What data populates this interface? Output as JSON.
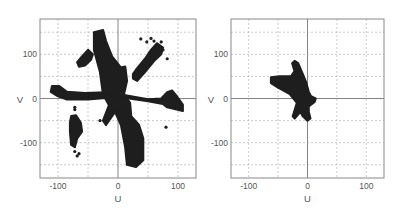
{
  "chart_data": [
    {
      "type": "scatter",
      "panel": "left",
      "title": "",
      "xlabel": "U",
      "ylabel": "V",
      "xlim": [
        -130,
        130
      ],
      "ylim": [
        -180,
        180
      ],
      "xticks": [
        -100,
        0,
        100
      ],
      "yticks": [
        100,
        0,
        -100
      ],
      "grid": true,
      "grid_step": 50,
      "description": "Dense (u,v) coverage sampling with a central cross and several outlying arms",
      "regions": [
        {
          "name": "central-ne-sw-arm",
          "polygon": [
            [
              -40,
              150
            ],
            [
              -25,
              155
            ],
            [
              -20,
              130
            ],
            [
              -10,
              95
            ],
            [
              5,
              70
            ],
            [
              12,
              72
            ],
            [
              15,
              40
            ],
            [
              10,
              10
            ],
            [
              20,
              -10
            ],
            [
              22,
              -40
            ],
            [
              35,
              -60
            ],
            [
              42,
              -90
            ],
            [
              42,
              -140
            ],
            [
              30,
              -155
            ],
            [
              15,
              -150
            ],
            [
              12,
              -110
            ],
            [
              5,
              -60
            ],
            [
              -5,
              -30
            ],
            [
              -20,
              -60
            ],
            [
              -25,
              -50
            ],
            [
              -15,
              -15
            ],
            [
              -25,
              10
            ],
            [
              -30,
              60
            ],
            [
              -40,
              110
            ]
          ]
        },
        {
          "name": "west-arm",
          "polygon": [
            [
              -110,
              28
            ],
            [
              -98,
              28
            ],
            [
              -85,
              15
            ],
            [
              -55,
              12
            ],
            [
              -20,
              14
            ],
            [
              -15,
              2
            ],
            [
              -50,
              -2
            ],
            [
              -85,
              -2
            ],
            [
              -100,
              5
            ],
            [
              -112,
              15
            ]
          ]
        },
        {
          "name": "east-arm",
          "polygon": [
            [
              10,
              2
            ],
            [
              50,
              -6
            ],
            [
              75,
              -12
            ],
            [
              82,
              -20
            ],
            [
              108,
              -28
            ],
            [
              108,
              -14
            ],
            [
              98,
              5
            ],
            [
              90,
              18
            ],
            [
              82,
              14
            ],
            [
              72,
              0
            ],
            [
              50,
              -2
            ],
            [
              10,
              8
            ]
          ]
        },
        {
          "name": "nw-cluster",
          "polygon": [
            [
              -68,
              82
            ],
            [
              -60,
              95
            ],
            [
              -50,
              110
            ],
            [
              -42,
              100
            ],
            [
              -45,
              88
            ],
            [
              -55,
              75
            ],
            [
              -65,
              72
            ]
          ]
        },
        {
          "name": "ne-arm",
          "polygon": [
            [
              25,
              45
            ],
            [
              32,
              40
            ],
            [
              45,
              60
            ],
            [
              60,
              85
            ],
            [
              72,
              100
            ],
            [
              75,
              115
            ],
            [
              65,
              125
            ],
            [
              55,
              110
            ],
            [
              45,
              90
            ],
            [
              30,
              65
            ],
            [
              25,
              55
            ]
          ]
        },
        {
          "name": "sw-cluster",
          "polygon": [
            [
              -78,
              -40
            ],
            [
              -70,
              -38
            ],
            [
              -62,
              -55
            ],
            [
              -60,
              -75
            ],
            [
              -68,
              -90
            ],
            [
              -72,
              -110
            ],
            [
              -78,
              -105
            ],
            [
              -80,
              -75
            ],
            [
              -80,
              -55
            ]
          ]
        }
      ],
      "points": [
        [
          -72,
          -25
        ],
        [
          -68,
          -130
        ],
        [
          -72,
          -120
        ],
        [
          55,
          136
        ],
        [
          60,
          130
        ],
        [
          72,
          128
        ],
        [
          75,
          110
        ],
        [
          82,
          90
        ],
        [
          80,
          -65
        ],
        [
          48,
          128
        ],
        [
          38,
          135
        ],
        [
          65,
          120
        ],
        [
          -30,
          -50
        ],
        [
          -72,
          -20
        ],
        [
          -65,
          -125
        ]
      ],
      "point_color": "#1e1e1e"
    },
    {
      "type": "scatter",
      "panel": "right",
      "title": "",
      "xlabel": "U",
      "ylabel": "V",
      "xlim": [
        -130,
        130
      ],
      "ylim": [
        -180,
        180
      ],
      "xticks": [
        -100,
        0,
        100
      ],
      "yticks": [
        100,
        0,
        -100
      ],
      "grid": true,
      "grid_step": 50,
      "description": "Compact (u,v) coverage shaped like an airplane silhouette near the origin",
      "regions": [
        {
          "name": "central-blob",
          "polygon": [
            [
              -22,
              85
            ],
            [
              -16,
              80
            ],
            [
              -8,
              55
            ],
            [
              -2,
              35
            ],
            [
              2,
              15
            ],
            [
              6,
              5
            ],
            [
              14,
              0
            ],
            [
              12,
              -8
            ],
            [
              2,
              -18
            ],
            [
              2,
              -30
            ],
            [
              5,
              -45
            ],
            [
              0,
              -50
            ],
            [
              -8,
              -40
            ],
            [
              -12,
              -30
            ],
            [
              -22,
              -45
            ],
            [
              -25,
              -40
            ],
            [
              -18,
              -10
            ],
            [
              -30,
              10
            ],
            [
              -50,
              25
            ],
            [
              -62,
              35
            ],
            [
              -62,
              48
            ],
            [
              -48,
              50
            ],
            [
              -28,
              50
            ],
            [
              -22,
              62
            ],
            [
              -26,
              80
            ]
          ]
        }
      ],
      "points": [],
      "point_color": "#1e1e1e"
    }
  ],
  "panels": {
    "left": {
      "x_label": "U",
      "y_label": "V",
      "ticks_x": [
        "-100",
        "0",
        "100"
      ],
      "ticks_y": [
        "100",
        "0",
        "-100"
      ]
    },
    "right": {
      "x_label": "U",
      "y_label": "V",
      "ticks_x": [
        "-100",
        "0",
        "100"
      ],
      "ticks_y": [
        "100",
        "0",
        "-100"
      ]
    }
  },
  "colors": {
    "frame": "#888888",
    "grid": "#aaaaaa",
    "axis_zero": "#777777",
    "data": "#1e1e1e",
    "text": "#555555"
  }
}
